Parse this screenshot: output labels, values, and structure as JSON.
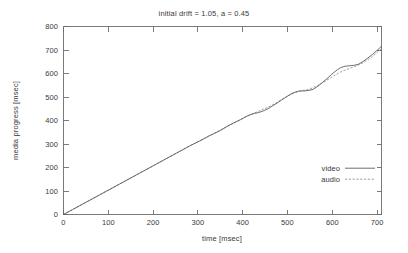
{
  "chart_data": {
    "type": "line",
    "title": "initial drift = 1.05, a = 0.45",
    "xlabel": "time [msec]",
    "ylabel": "media progress [msec]",
    "xlim": [
      0,
      700
    ],
    "ylim": [
      0,
      800
    ],
    "xticks": [
      0,
      100,
      200,
      300,
      400,
      500,
      600,
      700
    ],
    "yticks": [
      0,
      100,
      200,
      300,
      400,
      500,
      600,
      700,
      800
    ],
    "grid": false,
    "legend_position": "lower right",
    "frame": "box",
    "series": [
      {
        "name": "video",
        "style": "solid",
        "color": "#555555",
        "x": [
          0,
          20,
          40,
          60,
          80,
          100,
          120,
          140,
          160,
          180,
          200,
          220,
          240,
          260,
          280,
          300,
          310,
          320,
          330,
          345,
          360,
          375,
          390,
          400,
          410,
          420,
          430,
          440,
          450,
          460,
          470,
          480,
          490,
          500,
          510,
          520,
          530,
          540,
          550,
          560,
          570,
          580,
          590,
          600,
          610,
          620,
          630,
          640,
          650,
          660,
          670,
          680,
          690,
          700
        ],
        "y": [
          0,
          21,
          42,
          63,
          84,
          105,
          126,
          147,
          168,
          189,
          210,
          231,
          252,
          273,
          294,
          313,
          323,
          334,
          343,
          357,
          375,
          390,
          404,
          415,
          424,
          430,
          434,
          441,
          450,
          462,
          474,
          487,
          500,
          512,
          521,
          526,
          526,
          528,
          533,
          546,
          562,
          578,
          596,
          612,
          625,
          631,
          633,
          635,
          640,
          652,
          666,
          681,
          698,
          716
        ],
        "y_unit": "msec"
      },
      {
        "name": "audio",
        "style": "dashed",
        "color": "#8a8a8a",
        "x": [
          0,
          20,
          40,
          60,
          80,
          100,
          120,
          140,
          160,
          180,
          200,
          220,
          240,
          260,
          280,
          300,
          310,
          320,
          330,
          345,
          360,
          375,
          390,
          400,
          410,
          420,
          430,
          440,
          450,
          460,
          470,
          480,
          490,
          500,
          510,
          520,
          530,
          540,
          550,
          560,
          570,
          580,
          590,
          600,
          610,
          620,
          630,
          640,
          650,
          660,
          670,
          680,
          690,
          700
        ],
        "y": [
          0,
          21,
          42,
          63,
          84,
          105,
          126,
          147,
          168,
          189,
          210,
          231,
          252,
          273,
          294,
          314,
          324,
          334,
          344,
          359,
          374,
          389,
          404,
          414,
          423,
          432,
          440,
          448,
          456,
          466,
          477,
          489,
          500,
          511,
          519,
          524,
          528,
          533,
          540,
          549,
          560,
          572,
          584,
          596,
          606,
          615,
          622,
          629,
          637,
          647,
          659,
          673,
          689,
          706
        ],
        "y_unit": "msec"
      }
    ]
  },
  "legend": {
    "entries": [
      {
        "label": "video"
      },
      {
        "label": "audio"
      }
    ]
  }
}
